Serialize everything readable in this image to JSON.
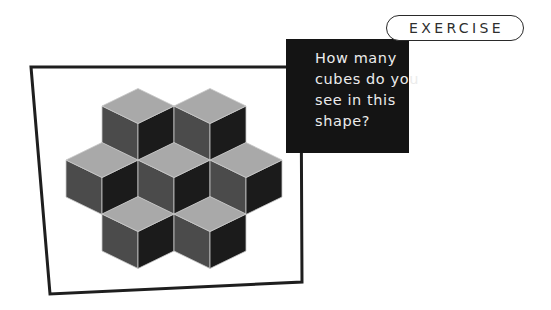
{
  "badge": {
    "label": "EXERCISE"
  },
  "question": {
    "lines": [
      "How many",
      "cubes do you",
      "see in this",
      "shape?"
    ]
  },
  "figure": {
    "visible_cube_count": 7,
    "rows": [
      {
        "cubes": 2,
        "centers_x": [
          138,
          210
        ],
        "top_y": 88.5
      },
      {
        "cubes": 3,
        "centers_x": [
          102,
          174,
          246
        ],
        "top_y": 142.5
      },
      {
        "cubes": 2,
        "centers_x": [
          138,
          210
        ],
        "top_y": 196.5
      }
    ],
    "colors": {
      "top_face": "#a9a9a9",
      "left_face": "#4b4b4b",
      "right_face": "#1b1b1b",
      "edge": "#c9c9c9",
      "frame": "#1e1e1e",
      "question_box": "#141414"
    }
  }
}
